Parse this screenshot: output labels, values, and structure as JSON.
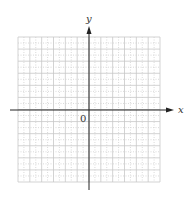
{
  "chart_data": {
    "type": "scatter",
    "title": "",
    "xlabel": "x",
    "ylabel": "y",
    "origin_label": "0",
    "grid": true,
    "grid_style": "major solid light gray, minor dotted",
    "xlim": [
      -6,
      6
    ],
    "ylim": [
      -6,
      6
    ],
    "series": []
  },
  "labels": {
    "x_axis": "x",
    "y_axis": "y",
    "origin": "0"
  },
  "colors": {
    "axis": "#222222",
    "grid_major": "#c8c8c8",
    "grid_minor": "#d0d0d0"
  }
}
